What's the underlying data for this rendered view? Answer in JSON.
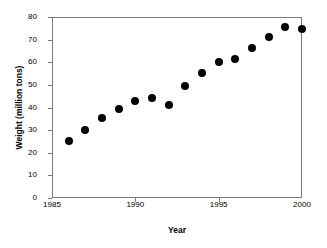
{
  "chart_data": {
    "type": "scatter",
    "title": "",
    "xlabel": "Year",
    "ylabel": "Weight (million tons)",
    "xlim": [
      1985,
      2000
    ],
    "ylim": [
      0,
      80
    ],
    "grid": false,
    "legend": null,
    "marker": {
      "shape": "filled-circle",
      "color": "#000000",
      "size_px": 8
    },
    "axis_color": "#7a7a7a",
    "background_color": "#ffffff",
    "x_ticks": [
      1985,
      1990,
      1995,
      2000
    ],
    "x_tick_labels": [
      "1985",
      "1990",
      "1995",
      "2000"
    ],
    "y_ticks": [
      0,
      10,
      20,
      30,
      40,
      50,
      60,
      70,
      80
    ],
    "y_tick_labels": [
      "0",
      "10",
      "20",
      "30",
      "40",
      "50",
      "60",
      "70",
      "80"
    ],
    "x": [
      1986,
      1987,
      1988,
      1989,
      1990,
      1991,
      1992,
      1993,
      1994,
      1995,
      1996,
      1997,
      1998,
      1999,
      2000
    ],
    "values": [
      25.2,
      30.0,
      35.4,
      39.2,
      43.0,
      44.2,
      41.0,
      49.6,
      55.3,
      60.0,
      61.5,
      66.5,
      71.3,
      75.4,
      74.8
    ],
    "series": [
      {
        "name": "Weight",
        "color": "#000000",
        "points": [
          {
            "x": 1986,
            "y": 25.2
          },
          {
            "x": 1987,
            "y": 30.0
          },
          {
            "x": 1988,
            "y": 35.4
          },
          {
            "x": 1989,
            "y": 39.2
          },
          {
            "x": 1990,
            "y": 43.0
          },
          {
            "x": 1991,
            "y": 44.2
          },
          {
            "x": 1992,
            "y": 41.0
          },
          {
            "x": 1993,
            "y": 49.6
          },
          {
            "x": 1994,
            "y": 55.3
          },
          {
            "x": 1995,
            "y": 60.0
          },
          {
            "x": 1996,
            "y": 61.5
          },
          {
            "x": 1997,
            "y": 66.5
          },
          {
            "x": 1998,
            "y": 71.3
          },
          {
            "x": 1999,
            "y": 75.4
          },
          {
            "x": 2000,
            "y": 74.8
          }
        ]
      }
    ]
  }
}
